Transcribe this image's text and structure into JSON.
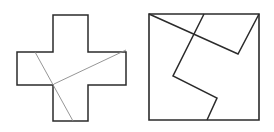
{
  "figure": {
    "colors": {
      "stroke": "#2b2b2b",
      "cut_line": "#8a8a8a",
      "background": "#ffffff"
    },
    "cross": {
      "outline": [
        [
          53,
          15
        ],
        [
          88,
          15
        ],
        [
          88,
          52
        ],
        [
          126,
          52
        ],
        [
          126,
          85
        ],
        [
          88,
          85
        ],
        [
          88,
          121
        ],
        [
          53,
          121
        ],
        [
          53,
          85
        ],
        [
          17,
          85
        ],
        [
          17,
          52
        ],
        [
          53,
          52
        ]
      ],
      "cuts": [
        [
          [
            35,
            52
          ],
          [
            73,
            121
          ]
        ],
        [
          [
            54,
            84
          ],
          [
            126,
            50
          ]
        ]
      ]
    },
    "square": {
      "outline": [
        [
          149,
          14
        ],
        [
          259,
          14
        ],
        [
          259,
          120
        ],
        [
          149,
          120
        ]
      ],
      "cuts": [
        [
          [
            149,
            14
          ],
          [
            238,
            54
          ],
          [
            259,
            14
          ]
        ],
        [
          [
            204,
            14
          ],
          [
            173,
            76
          ],
          [
            217,
            98
          ],
          [
            207,
            120
          ]
        ]
      ]
    }
  }
}
